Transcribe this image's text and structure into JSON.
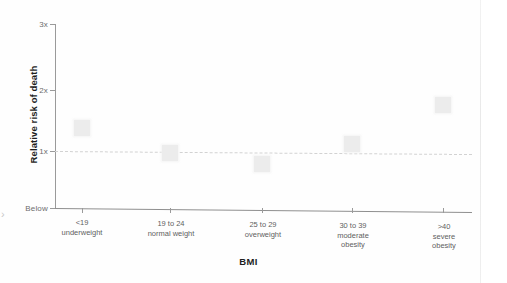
{
  "chart_data": {
    "type": "scatter",
    "title": "",
    "xlabel": "BMI",
    "ylabel": "Relative risk of death",
    "categories": [
      "<19\nunderweight",
      "19 to 24\nnormal weight",
      "25 to 29\noverweight",
      "30 to 39\nmoderate\nobesity",
      ">40\nsevere\nobesity"
    ],
    "category_primary": [
      "<19",
      "19 to 24",
      "25 to 29",
      "30 to 39",
      ">40"
    ],
    "category_secondary": [
      "underweight",
      "normal weight",
      "overweight",
      "moderate obesity",
      "severe obesity"
    ],
    "values": [
      1.37,
      0.98,
      0.82,
      1.15,
      1.77
    ],
    "ytick_labels": [
      "3x",
      "2x",
      "1x",
      "Below"
    ],
    "ytick_values": [
      3,
      2,
      1,
      0.1
    ],
    "ylim": [
      0.1,
      3
    ],
    "reference_line": {
      "value": 1,
      "style": "dashed",
      "color": "#d2d2d2"
    },
    "marker_color": "#ececec",
    "axis_color": "#9a9a9a",
    "grid": false,
    "legend": null
  },
  "edge_artifact": "›"
}
